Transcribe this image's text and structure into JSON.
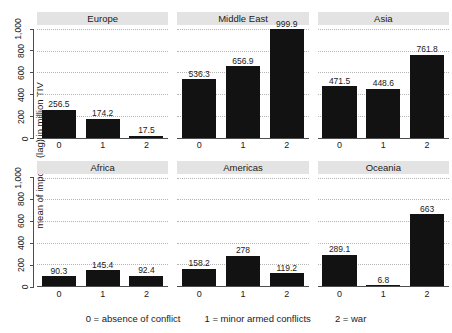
{
  "chart_data": {
    "type": "bar",
    "title": "",
    "xlabel": "",
    "ylabel": "mean of imports (lag) in million TIV",
    "ylim": [
      0,
      1000
    ],
    "yticks": [
      "0",
      "200",
      "400",
      "600",
      "800",
      "1,000"
    ],
    "ytick_values": [
      0,
      200,
      400,
      600,
      800,
      1000
    ],
    "categories": [
      "0",
      "1",
      "2"
    ],
    "grid": true,
    "legend": "none",
    "facet_layout": [
      2,
      3
    ],
    "panels": [
      {
        "name": "Europe",
        "categories": [
          "0",
          "1",
          "2"
        ],
        "values": [
          256.5,
          174.2,
          17.5
        ],
        "labels": [
          "256.5",
          "174.2",
          "17.5"
        ]
      },
      {
        "name": "Middle East",
        "categories": [
          "0",
          "1",
          "2"
        ],
        "values": [
          536.3,
          656.9,
          999.9
        ],
        "labels": [
          "536.3",
          "656.9",
          "999.9"
        ]
      },
      {
        "name": "Asia",
        "categories": [
          "0",
          "1",
          "2"
        ],
        "values": [
          471.5,
          448.6,
          761.8
        ],
        "labels": [
          "471.5",
          "448.6",
          "761.8"
        ]
      },
      {
        "name": "Africa",
        "categories": [
          "0",
          "1",
          "2"
        ],
        "values": [
          90.3,
          145.4,
          92.4
        ],
        "labels": [
          "90.3",
          "145.4",
          "92.4"
        ]
      },
      {
        "name": "Americas",
        "categories": [
          "0",
          "1",
          "2"
        ],
        "values": [
          158.2,
          278,
          119.2
        ],
        "labels": [
          "158.2",
          "278",
          "119.2"
        ]
      },
      {
        "name": "Oceania",
        "categories": [
          "0",
          "1",
          "2"
        ],
        "values": [
          289.1,
          6.8,
          663
        ],
        "labels": [
          "289.1",
          "6.8",
          "663"
        ]
      }
    ],
    "caption_items": [
      "0 = absence of conflict",
      "1 = minor armed conflicts",
      "2 = war"
    ],
    "colors": {
      "bar": "#121212",
      "strip_background": "#e3e3e3",
      "gridline": "#b4b4b4",
      "axis": "#4d4d4d",
      "text": "#1a1a1a",
      "background": "#ffffff"
    }
  }
}
